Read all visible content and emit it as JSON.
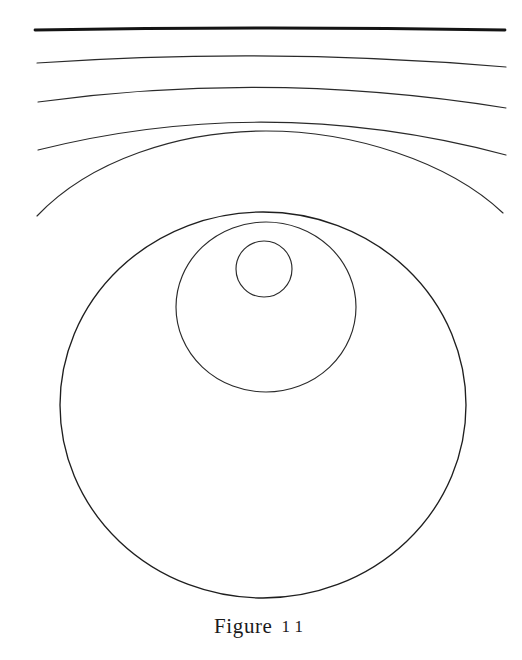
{
  "figure": {
    "caption_word": "Figure",
    "caption_number": "11",
    "caption_full": "Figure 11",
    "background_color": "#ffffff",
    "ink_color": "#1a1a1a"
  },
  "diagram": {
    "canvas": {
      "width": 522,
      "height": 660
    },
    "wavefront_arcs": [
      {
        "name": "arc-1-straight",
        "order": 1,
        "stroke_width": 2.6,
        "color": "#141414",
        "x_start": 35,
        "y_start": 30,
        "x_mid": 270,
        "y_mid": 28,
        "x_end": 505,
        "y_end": 30
      },
      {
        "name": "arc-2",
        "order": 2,
        "stroke_width": 1.1,
        "color": "#2a2a2a",
        "x_start": 37,
        "y_start": 63,
        "x_mid": 270,
        "y_mid": 55,
        "x_end": 506,
        "y_end": 67
      },
      {
        "name": "arc-3",
        "order": 3,
        "stroke_width": 1.1,
        "color": "#2a2a2a",
        "x_start": 38,
        "y_start": 102,
        "x_mid": 270,
        "y_mid": 86,
        "x_end": 506,
        "y_end": 108
      },
      {
        "name": "arc-4",
        "order": 4,
        "stroke_width": 1.1,
        "color": "#2a2a2a",
        "x_start": 38,
        "y_start": 150,
        "x_mid": 268,
        "y_mid": 121,
        "x_end": 506,
        "y_end": 155
      },
      {
        "name": "arc-5",
        "order": 5,
        "stroke_width": 1.1,
        "color": "#2a2a2a",
        "x_start": 37,
        "y_start": 216,
        "x_mid": 266,
        "y_mid": 156,
        "x_end": 503,
        "y_end": 213
      }
    ],
    "ovals": [
      {
        "name": "outer-oval",
        "order": 6,
        "cx": 263,
        "cy": 405,
        "rx": 203,
        "ry": 193,
        "stroke_width": 1.3,
        "color": "#1f1f1f"
      },
      {
        "name": "middle-oval",
        "order": 7,
        "cx": 266,
        "cy": 307,
        "rx": 90,
        "ry": 85,
        "stroke_width": 1.1,
        "color": "#2a2a2a"
      },
      {
        "name": "inner-oval",
        "order": 8,
        "cx": 264,
        "cy": 269,
        "rx": 28,
        "ry": 28,
        "stroke_width": 1.1,
        "color": "#2a2a2a"
      }
    ]
  }
}
